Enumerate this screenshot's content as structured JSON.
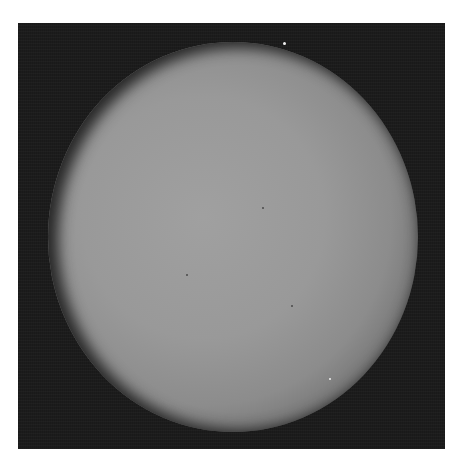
{
  "image": {
    "subject": "Photograph of a planetary disk (sunlit sphere) against dark sky",
    "background_color": "#ffffff",
    "frame_color": "#1c1c1c",
    "disk_center_color": "#a0a0a0",
    "disk_limb_color": "#3a3a3a"
  },
  "features": [
    {
      "name": "bright-speck-top",
      "type": "bright",
      "x": 283,
      "y": 43
    },
    {
      "name": "bright-speck-lower-right",
      "type": "bright",
      "x": 329,
      "y": 378
    },
    {
      "name": "dark-spot-center",
      "type": "dark",
      "x": 186,
      "y": 274
    },
    {
      "name": "dark-spot-right",
      "type": "dark",
      "x": 291,
      "y": 305
    },
    {
      "name": "dark-spot-upper",
      "type": "dark",
      "x": 262,
      "y": 207
    }
  ]
}
